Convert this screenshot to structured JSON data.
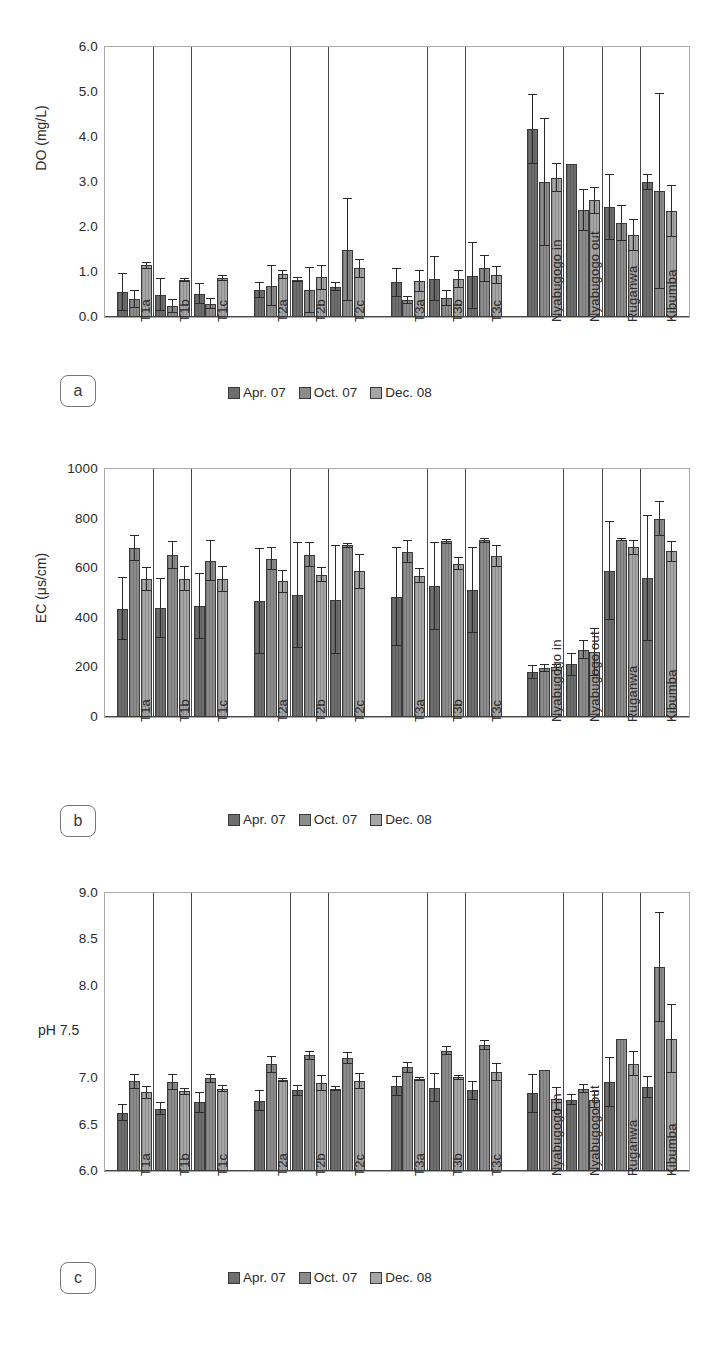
{
  "figure": {
    "series_labels": [
      "Apr. 07",
      "Oct. 07",
      "Dec. 08"
    ],
    "series_colors": [
      "#6e6e6e",
      "#8c8c8c",
      "#a6a6a6"
    ],
    "categories": [
      "T1a",
      "T1b",
      "T1c",
      "T2a",
      "T2b",
      "T2c",
      "T3a",
      "T3b",
      "T3c",
      "Nyabugogo in",
      "Nyabugogo out",
      "Ruganwa",
      "Kibumba"
    ],
    "panel_labels": [
      "a",
      "b",
      "c"
    ]
  },
  "chart_data": [
    {
      "type": "bar",
      "panel": "a",
      "title": "",
      "ylabel": "DO (mg/L)",
      "xlabel": "",
      "ylim": [
        0.0,
        6.0
      ],
      "yticks": [
        "0.0",
        "1.0",
        "2.0",
        "3.0",
        "4.0",
        "5.0",
        "6.0"
      ],
      "grid": false,
      "legend_position": "bottom-center",
      "categories": [
        "T1a",
        "T1b",
        "T1c",
        "T2a",
        "T2b",
        "T2c",
        "T3a",
        "T3b",
        "T3c",
        "Nyabugogo in",
        "Nyabugogo out",
        "Ruganwa",
        "Kibumba"
      ],
      "series": [
        {
          "name": "Apr. 07",
          "values": [
            0.55,
            0.5,
            0.52,
            0.6,
            0.83,
            0.67,
            0.77,
            0.85,
            0.92,
            4.18,
            3.4,
            2.44,
            3.0
          ],
          "errors": [
            0.42,
            0.37,
            0.23,
            0.17,
            0.05,
            0.1,
            0.33,
            0.5,
            0.75,
            0.77,
            0.0,
            0.73,
            0.18
          ]
        },
        {
          "name": "Oct. 07",
          "values": [
            0.4,
            0.25,
            0.3,
            0.7,
            0.6,
            1.5,
            0.38,
            0.42,
            1.08,
            3.0,
            2.38,
            2.1,
            2.8
          ],
          "errors": [
            0.2,
            0.15,
            0.12,
            0.45,
            0.52,
            1.15,
            0.08,
            0.18,
            0.3,
            1.43,
            0.47,
            0.4,
            2.17
          ]
        },
        {
          "name": "Dec. 08",
          "values": [
            1.15,
            0.82,
            0.87,
            0.95,
            0.88,
            1.08,
            0.8,
            0.85,
            0.93,
            3.1,
            2.6,
            1.82,
            2.35
          ],
          "errors": [
            0.08,
            0.04,
            0.06,
            0.1,
            0.28,
            0.22,
            0.25,
            0.2,
            0.2,
            0.32,
            0.3,
            0.35,
            0.58
          ]
        }
      ]
    },
    {
      "type": "bar",
      "panel": "b",
      "title": "",
      "ylabel": "EC (μs/cm)",
      "xlabel": "",
      "ylim": [
        0,
        1000
      ],
      "yticks": [
        "0",
        "200",
        "400",
        "600",
        "800",
        "1000"
      ],
      "grid": false,
      "legend_position": "bottom-center",
      "categories": [
        "T1a",
        "T1b",
        "T1c",
        "T2a",
        "T2b",
        "T2c",
        "T3a",
        "T3b",
        "T3c",
        "Nyabugogo in",
        "Nyabugogo out",
        "Ruganwa",
        "Kibumba"
      ],
      "series": [
        {
          "name": "Apr. 07",
          "values": [
            437,
            440,
            448,
            468,
            492,
            473,
            485,
            527,
            512,
            180,
            212,
            590,
            560
          ],
          "errors": [
            127,
            122,
            132,
            212,
            215,
            220,
            200,
            178,
            175,
            28,
            48,
            200,
            255
          ]
        },
        {
          "name": "Oct. 07",
          "values": [
            682,
            653,
            630,
            638,
            655,
            692,
            667,
            708,
            712,
            197,
            272,
            715,
            800
          ],
          "errors": [
            52,
            55,
            82,
            47,
            52,
            10,
            45,
            10,
            10,
            15,
            40,
            5,
            70
          ]
        },
        {
          "name": "Dec. 08",
          "values": [
            558,
            557,
            557,
            547,
            573,
            588,
            570,
            618,
            650,
            200,
            262,
            685,
            668
          ],
          "errors": [
            48,
            50,
            52,
            47,
            30,
            70,
            30,
            27,
            45,
            13,
            95,
            30,
            42
          ]
        }
      ]
    },
    {
      "type": "bar",
      "panel": "c",
      "title": "",
      "ylabel": "pH 7.5",
      "xlabel": "",
      "ylim": [
        6.0,
        9.0
      ],
      "yticks": [
        "6.0",
        "6.5",
        "7.0",
        "7.5",
        "8.0",
        "8.5",
        "9.0"
      ],
      "grid": false,
      "legend_position": "bottom-center",
      "categories": [
        "T1a",
        "T1b",
        "T1c",
        "T2a",
        "T2b",
        "T2c",
        "T3a",
        "T3b",
        "T3c",
        "Nyabugogo in",
        "Nyabugogo out",
        "Ruganwa",
        "Kibumba"
      ],
      "series": [
        {
          "name": "Apr. 07",
          "values": [
            6.63,
            6.67,
            6.74,
            6.76,
            6.87,
            6.89,
            6.92,
            6.9,
            6.87,
            6.84,
            6.77,
            6.96,
            6.91
          ],
          "errors": [
            0.09,
            0.07,
            0.11,
            0.11,
            0.06,
            0.03,
            0.11,
            0.16,
            0.1,
            0.21,
            0.06,
            0.27,
            0.12
          ]
        },
        {
          "name": "Oct. 07",
          "values": [
            6.97,
            6.96,
            7.0,
            7.15,
            7.25,
            7.22,
            7.12,
            7.3,
            7.36,
            7.09,
            6.89,
            7.43,
            8.2
          ],
          "errors": [
            0.08,
            0.09,
            0.05,
            0.09,
            0.05,
            0.06,
            0.06,
            0.05,
            0.05,
            0.0,
            0.05,
            0.0,
            0.59
          ]
        },
        {
          "name": "Dec. 08",
          "values": [
            6.85,
            6.86,
            6.89,
            6.98,
            6.95,
            6.97,
            6.99,
            7.01,
            7.07,
            6.78,
            6.77,
            7.16,
            7.43
          ],
          "errors": [
            0.07,
            0.04,
            0.04,
            0.02,
            0.09,
            0.09,
            0.02,
            0.03,
            0.1,
            0.13,
            0.09,
            0.13,
            0.37
          ]
        }
      ]
    }
  ]
}
